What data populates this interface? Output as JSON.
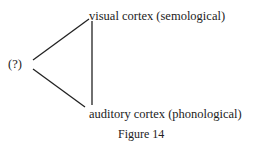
{
  "diagram": {
    "root_label": "(?)",
    "nodes": [
      {
        "label": "visual cortex (semological)"
      },
      {
        "label": "auditory cortex (phonological)"
      }
    ],
    "caption": "Figure 14"
  }
}
